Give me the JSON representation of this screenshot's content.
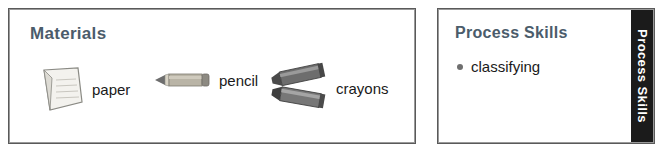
{
  "materials": {
    "title": "Materials",
    "items": [
      {
        "label": "paper",
        "icon": "paper-sheet-icon"
      },
      {
        "label": "pencil",
        "icon": "pencil-icon"
      },
      {
        "label": "crayons",
        "icon": "crayons-icon"
      }
    ]
  },
  "process_skills": {
    "title": "Process Skills",
    "side_tab_label": "Process Skills",
    "skills": [
      {
        "label": "classifying"
      }
    ]
  },
  "colors": {
    "heading": "#4b5c6b",
    "body_text": "#1a1a1a",
    "border": "#5a5a5a",
    "tab_background": "#1b1b1b",
    "tab_text": "#ffffff"
  }
}
